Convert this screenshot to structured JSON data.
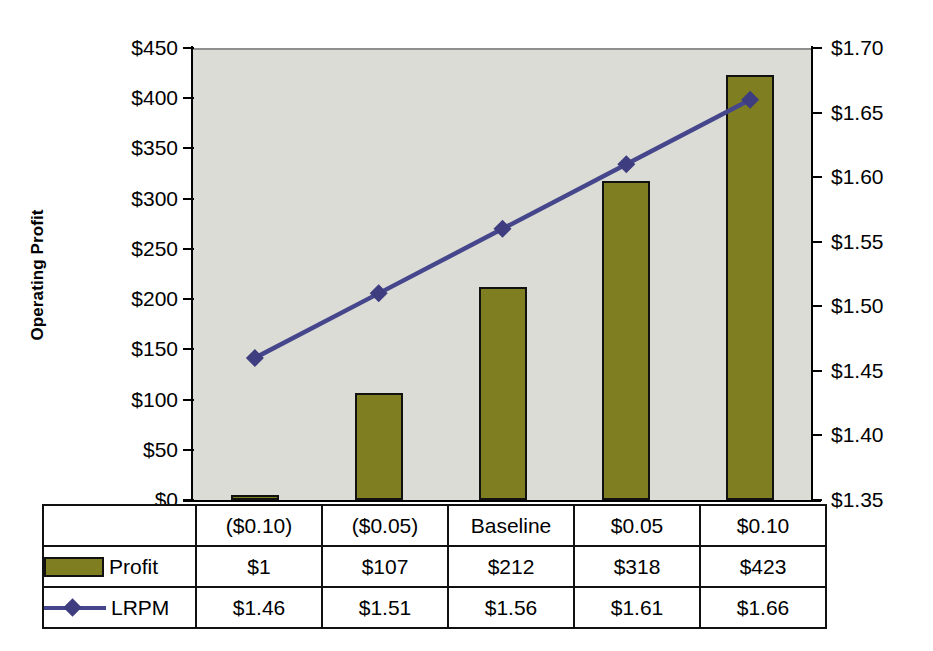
{
  "chart_data": {
    "type": "bar",
    "title": "",
    "categories": [
      "($0.10)",
      "($0.05)",
      "Baseline",
      "$0.05",
      "$0.10"
    ],
    "xlabel": "",
    "grid": false,
    "legend_position": "bottom-table",
    "series": [
      {
        "name": "Profit",
        "type": "bar",
        "axis": "left",
        "color": "#7f7f21",
        "values": [
          1,
          107,
          212,
          318,
          423
        ],
        "labels": [
          "$1",
          "$107",
          "$212",
          "$318",
          "$423"
        ]
      },
      {
        "name": "LRPM",
        "type": "line",
        "axis": "right",
        "color": "#46468c",
        "marker": "diamond",
        "values": [
          1.46,
          1.51,
          1.56,
          1.61,
          1.66
        ],
        "labels": [
          "$1.46",
          "$1.51",
          "$1.56",
          "$1.61",
          "$1.66"
        ]
      }
    ],
    "left_axis": {
      "label": "Operating Profit",
      "ylim": [
        0,
        450
      ],
      "tick_step": 50,
      "ticks": [
        "$0",
        "$50",
        "$100",
        "$150",
        "$200",
        "$250",
        "$300",
        "$350",
        "$400",
        "$450"
      ],
      "tick_values": [
        0,
        50,
        100,
        150,
        200,
        250,
        300,
        350,
        400,
        450
      ]
    },
    "right_axis": {
      "label": "Loaded Revenue Per Mile (LRPM)",
      "ylim": [
        1.35,
        1.7
      ],
      "tick_step": 0.05,
      "ticks": [
        "$1.35",
        "$1.40",
        "$1.45",
        "$1.50",
        "$1.55",
        "$1.60",
        "$1.65",
        "$1.70"
      ],
      "tick_values": [
        1.35,
        1.4,
        1.45,
        1.5,
        1.55,
        1.6,
        1.65,
        1.7
      ]
    }
  },
  "table": {
    "category_row": [
      "($0.10)",
      "($0.05)",
      "Baseline",
      "$0.05",
      "$0.10"
    ],
    "rows": [
      {
        "legend": "Profit",
        "marker": "bar-swatch",
        "values": [
          "$1",
          "$107",
          "$212",
          "$318",
          "$423"
        ]
      },
      {
        "legend": "LRPM",
        "marker": "line-diamond",
        "values": [
          "$1.46",
          "$1.51",
          "$1.56",
          "$1.61",
          "$1.66"
        ]
      }
    ]
  },
  "colors": {
    "bar_fill": "#7f7f21",
    "bar_stroke": "#111111",
    "line": "#46468c",
    "marker": "#3d3d80",
    "plot_background": "#dcdcd6",
    "axis": "#000000"
  }
}
